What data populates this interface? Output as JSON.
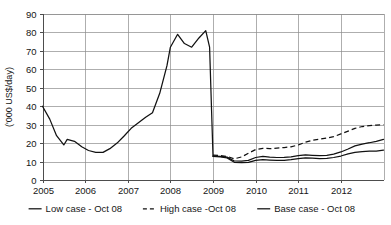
{
  "chart_data": {
    "type": "line",
    "title": "",
    "xlabel": "",
    "ylabel": "('000 US$/day)",
    "ylim": [
      0,
      90
    ],
    "ytick_labels": [
      "0",
      "10",
      "20",
      "30",
      "40",
      "50",
      "60",
      "70",
      "80",
      "90"
    ],
    "yticks": [
      0,
      10,
      20,
      30,
      40,
      50,
      60,
      70,
      80,
      90
    ],
    "xlim": [
      2005,
      2013
    ],
    "xtick_labels": [
      "2005",
      "2006",
      "2007",
      "2008",
      "2009",
      "2010",
      "2011",
      "2012"
    ],
    "xticks": [
      2005,
      2006,
      2007,
      2008,
      2009,
      2010,
      2011,
      2012
    ],
    "grid": true,
    "legend_position": "bottom",
    "legend": [
      {
        "label": "Low case - Oct 08",
        "style": "solid"
      },
      {
        "label": "High case -Oct 08",
        "style": "dashed"
      },
      {
        "label": "Base case - Oct 08",
        "style": "solid"
      }
    ],
    "series": [
      {
        "name": "Historical",
        "style": "solid",
        "x": [
          2005.0,
          2005.17,
          2005.33,
          2005.5,
          2005.58,
          2005.75,
          2005.92,
          2006.08,
          2006.25,
          2006.42,
          2006.58,
          2006.75,
          2006.92,
          2007.08,
          2007.25,
          2007.42,
          2007.58,
          2007.75,
          2007.92,
          2008.0,
          2008.17,
          2008.33,
          2008.5,
          2008.67,
          2008.83,
          2008.92,
          2009.0
        ],
        "y": [
          40,
          33,
          24,
          19,
          22,
          21,
          18,
          16,
          15,
          15,
          17,
          20,
          24,
          28,
          31,
          34,
          36.5,
          47,
          62,
          72,
          79,
          74,
          72,
          77,
          81,
          72,
          13
        ]
      },
      {
        "name": "High case -Oct 08",
        "style": "dashed",
        "x": [
          2009.0,
          2009.17,
          2009.33,
          2009.5,
          2009.67,
          2009.83,
          2010.0,
          2010.17,
          2010.33,
          2010.5,
          2010.67,
          2010.83,
          2011.0,
          2011.17,
          2011.33,
          2011.5,
          2011.67,
          2011.83,
          2012.0,
          2012.17,
          2012.33,
          2012.5,
          2012.67,
          2012.83,
          2013.0
        ],
        "y": [
          13.5,
          13.2,
          12.8,
          11.5,
          12.5,
          14.5,
          16.5,
          17.2,
          17.0,
          17.3,
          17.6,
          18.0,
          19.0,
          20.5,
          21.5,
          22.2,
          22.8,
          23.5,
          25.0,
          26.5,
          28.0,
          29.0,
          29.5,
          29.8,
          30.0
        ]
      },
      {
        "name": "Base case - Oct 08",
        "style": "solid",
        "x": [
          2009.0,
          2009.17,
          2009.33,
          2009.5,
          2009.67,
          2009.83,
          2010.0,
          2010.17,
          2010.33,
          2010.5,
          2010.67,
          2010.83,
          2011.0,
          2011.17,
          2011.33,
          2011.5,
          2011.67,
          2011.83,
          2012.0,
          2012.17,
          2012.33,
          2012.5,
          2012.67,
          2012.83,
          2013.0
        ],
        "y": [
          13.0,
          12.8,
          12.4,
          10.3,
          10.2,
          10.6,
          12.2,
          12.8,
          12.4,
          12.2,
          12.3,
          12.6,
          13.2,
          13.6,
          13.4,
          13.2,
          13.4,
          14.0,
          15.2,
          16.8,
          18.5,
          19.5,
          20.2,
          21.0,
          22.0
        ]
      },
      {
        "name": "Low case - Oct 08",
        "style": "solid",
        "x": [
          2009.0,
          2009.17,
          2009.33,
          2009.5,
          2009.67,
          2009.83,
          2010.0,
          2010.17,
          2010.33,
          2010.5,
          2010.67,
          2010.83,
          2011.0,
          2011.17,
          2011.33,
          2011.5,
          2011.67,
          2011.83,
          2012.0,
          2012.17,
          2012.33,
          2012.5,
          2012.67,
          2012.83,
          2013.0
        ],
        "y": [
          12.8,
          12.5,
          12.0,
          9.6,
          9.4,
          9.6,
          10.6,
          11.0,
          10.8,
          10.6,
          10.7,
          11.0,
          11.6,
          12.0,
          11.8,
          11.6,
          11.7,
          12.2,
          13.0,
          14.2,
          15.0,
          15.4,
          15.6,
          15.6,
          16.2
        ]
      }
    ]
  }
}
